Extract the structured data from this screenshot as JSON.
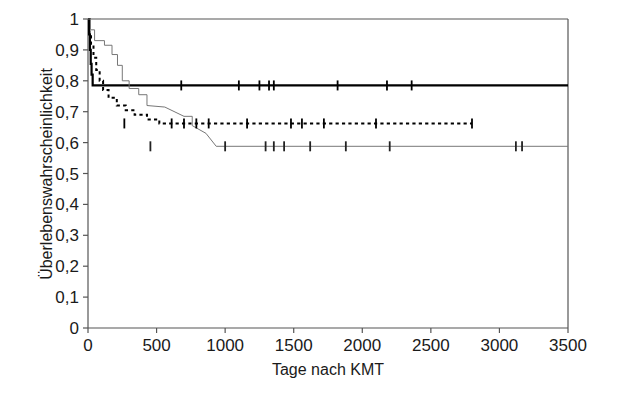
{
  "figure": {
    "background_color": "#ffffff",
    "frame_color": "#555555",
    "curve_colors": {
      "bold_solid": "#000000",
      "dashed": "#000000",
      "thin_solid": "#777777"
    }
  },
  "chart_data": {
    "type": "line",
    "title": "",
    "subtitle": "",
    "xlabel": "Tage nach KMT",
    "ylabel": "Überlebenswahrscheinlichkeit",
    "xlim": [
      0,
      3500
    ],
    "ylim": [
      0,
      1
    ],
    "xticks": [
      0,
      500,
      1000,
      1500,
      2000,
      2500,
      3000,
      3500
    ],
    "xtick_labels": [
      "0",
      "500",
      "1000",
      "1500",
      "2000",
      "2500",
      "3000",
      "3500"
    ],
    "yticks": [
      0,
      0.1,
      0.2,
      0.3,
      0.4,
      0.5,
      0.6,
      0.7,
      0.8,
      0.9,
      1
    ],
    "ytick_labels": [
      "0",
      "0,1",
      "0,2",
      "0,3",
      "0,4",
      "0,5",
      "0,6",
      "0,7",
      "0,8",
      "0,9",
      "1"
    ],
    "grid": false,
    "legend": "none",
    "annotations": [],
    "series": [
      {
        "name": "bold-solid-curve",
        "style": "solid",
        "line_width": 2.2,
        "color": "#000000",
        "plateau_value": 0.785,
        "end_x": 3500,
        "points": [
          [
            0,
            1.0
          ],
          [
            8,
            1.0
          ],
          [
            8,
            0.95
          ],
          [
            14,
            0.95
          ],
          [
            14,
            0.9
          ],
          [
            20,
            0.9
          ],
          [
            20,
            0.855
          ],
          [
            26,
            0.855
          ],
          [
            26,
            0.82
          ],
          [
            34,
            0.82
          ],
          [
            34,
            0.785
          ],
          [
            3500,
            0.785
          ]
        ],
        "censor_marks": [
          680,
          1100,
          1250,
          1320,
          1355,
          1820,
          2180,
          2360
        ]
      },
      {
        "name": "dashed-curve",
        "style": "dashed",
        "line_width": 2.0,
        "color": "#000000",
        "plateau_value": 0.662,
        "end_x": 2800,
        "points": [
          [
            0,
            1.0
          ],
          [
            10,
            1.0
          ],
          [
            10,
            0.955
          ],
          [
            22,
            0.955
          ],
          [
            22,
            0.915
          ],
          [
            40,
            0.915
          ],
          [
            40,
            0.875
          ],
          [
            60,
            0.875
          ],
          [
            60,
            0.835
          ],
          [
            85,
            0.835
          ],
          [
            85,
            0.8
          ],
          [
            110,
            0.8
          ],
          [
            110,
            0.77
          ],
          [
            150,
            0.77
          ],
          [
            150,
            0.745
          ],
          [
            210,
            0.745
          ],
          [
            210,
            0.72
          ],
          [
            275,
            0.72
          ],
          [
            275,
            0.705
          ],
          [
            340,
            0.705
          ],
          [
            340,
            0.69
          ],
          [
            430,
            0.69
          ],
          [
            430,
            0.675
          ],
          [
            520,
            0.675
          ],
          [
            520,
            0.662
          ],
          [
            2800,
            0.662
          ]
        ],
        "censor_marks": [
          265,
          610,
          700,
          790,
          880,
          1160,
          1480,
          1560,
          1720,
          2100,
          2800
        ]
      },
      {
        "name": "thin-solid-curve",
        "style": "solid",
        "line_width": 1.0,
        "color": "#777777",
        "plateau_value": 0.588,
        "end_x": 3500,
        "points": [
          [
            0,
            1.0
          ],
          [
            18,
            1.0
          ],
          [
            18,
            0.965
          ],
          [
            48,
            0.965
          ],
          [
            48,
            0.93
          ],
          [
            120,
            0.93
          ],
          [
            120,
            0.915
          ],
          [
            175,
            0.915
          ],
          [
            175,
            0.885
          ],
          [
            215,
            0.885
          ],
          [
            215,
            0.85
          ],
          [
            250,
            0.85
          ],
          [
            250,
            0.8
          ],
          [
            300,
            0.8
          ],
          [
            300,
            0.775
          ],
          [
            370,
            0.775
          ],
          [
            370,
            0.755
          ],
          [
            430,
            0.755
          ],
          [
            430,
            0.72
          ],
          [
            560,
            0.715
          ],
          [
            700,
            0.685
          ],
          [
            760,
            0.685
          ],
          [
            760,
            0.655
          ],
          [
            860,
            0.63
          ],
          [
            935,
            0.588
          ],
          [
            3500,
            0.588
          ]
        ],
        "censor_marks": [
          455,
          1000,
          1295,
          1355,
          1430,
          1620,
          1880,
          2200,
          3120,
          3165
        ]
      }
    ]
  },
  "axis": {
    "x_title": "Tage nach KMT",
    "y_title": "Überlebenswahrscheinlichkeit"
  }
}
